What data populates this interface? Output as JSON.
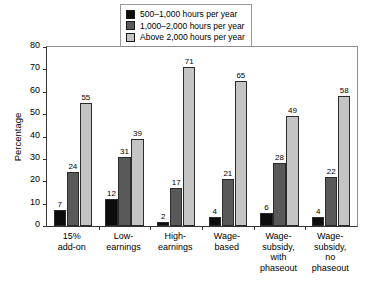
{
  "chart_data": {
    "type": "bar",
    "title": "",
    "xlabel": "",
    "ylabel": "Percentage",
    "ylim": [
      0,
      80
    ],
    "yticks": [
      0,
      10,
      20,
      30,
      40,
      50,
      60,
      70,
      80
    ],
    "grid": false,
    "legend_position": "top-center",
    "categories": [
      "15%\nadd-on",
      "Low-\nearnings",
      "High-\nearnings",
      "Wage-\nbased",
      "Wage-\nsubsidy,\nwith\nphaseout",
      "Wage-\nsubsidy,\nno\nphaseout"
    ],
    "series": [
      {
        "name": "500–1,000 hours per year",
        "color": "#0d0d0d",
        "values": [
          7,
          12,
          2,
          4,
          6,
          4
        ]
      },
      {
        "name": "1,000–2,000 hours per year",
        "color": "#595959",
        "values": [
          24,
          31,
          17,
          21,
          28,
          22
        ]
      },
      {
        "name": "Above 2,000 hours per year",
        "color": "#c4c4c4",
        "values": [
          55,
          39,
          71,
          65,
          49,
          58
        ]
      }
    ]
  },
  "legend": {
    "items": [
      {
        "label": "500–1,000 hours per year",
        "color": "#0d0d0d"
      },
      {
        "label": "1,000–2,000 hours per year",
        "color": "#595959"
      },
      {
        "label": "Above 2,000 hours per year",
        "color": "#c4c4c4"
      }
    ]
  },
  "axis": {
    "y_title": "Percentage",
    "y_tick_labels": [
      "80",
      "70",
      "60",
      "50",
      "40",
      "30",
      "20",
      "10",
      "0"
    ]
  }
}
